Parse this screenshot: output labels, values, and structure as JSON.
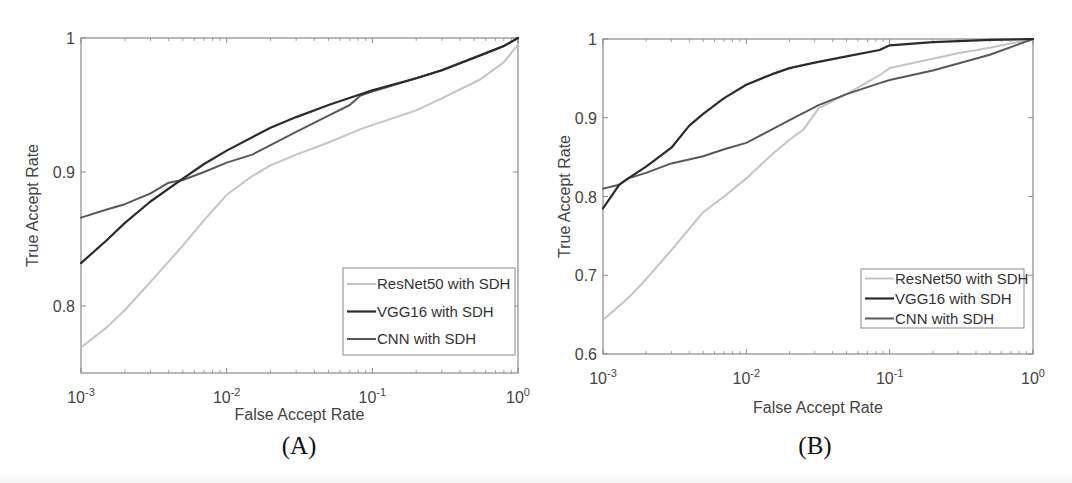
{
  "figure": {
    "panels": [
      {
        "id": "A",
        "caption": "(A)"
      },
      {
        "id": "B",
        "caption": "(B)"
      }
    ]
  },
  "colors": {
    "resnet50": "#c4c4c4",
    "vgg16": "#2b2b2b",
    "cnn": "#585858",
    "axis": "#8a8a8a",
    "text": "#444444"
  },
  "chart_data": [
    {
      "panel": "A",
      "type": "line",
      "title": "",
      "xlabel": "False Accept Rate",
      "ylabel": "True Accept Rate",
      "xscale": "log",
      "xlim": [
        0.001,
        1
      ],
      "ylim": [
        0.75,
        1
      ],
      "xticks": [
        0.001,
        0.01,
        0.1,
        1
      ],
      "xtick_labels": [
        [
          "10",
          "-3"
        ],
        [
          "10",
          "-2"
        ],
        [
          "10",
          "-1"
        ],
        [
          "10",
          "0"
        ]
      ],
      "yticks": [
        0.8,
        0.9,
        1
      ],
      "ytick_labels": [
        "0.8",
        "0.9",
        "1"
      ],
      "grid": false,
      "legend_position": "lower right",
      "legend": [
        "ResNet50 with SDH",
        "VGG16 with SDH",
        "CNN with SDH"
      ],
      "series": [
        {
          "name": "ResNet50 with SDH",
          "color_key": "resnet50",
          "width": 2,
          "x": [
            0.001,
            0.0015,
            0.002,
            0.003,
            0.005,
            0.007,
            0.01,
            0.015,
            0.02,
            0.03,
            0.05,
            0.083,
            0.1,
            0.2,
            0.3,
            0.55,
            0.8,
            1
          ],
          "y": [
            0.769,
            0.784,
            0.797,
            0.818,
            0.845,
            0.864,
            0.883,
            0.897,
            0.905,
            0.913,
            0.922,
            0.932,
            0.935,
            0.946,
            0.955,
            0.969,
            0.982,
            0.995
          ]
        },
        {
          "name": "VGG16 with SDH",
          "color_key": "vgg16",
          "width": 2.2,
          "x": [
            0.001,
            0.0015,
            0.002,
            0.003,
            0.005,
            0.007,
            0.01,
            0.015,
            0.02,
            0.03,
            0.05,
            0.083,
            0.1,
            0.2,
            0.3,
            0.55,
            0.8,
            1
          ],
          "y": [
            0.832,
            0.849,
            0.862,
            0.878,
            0.895,
            0.906,
            0.916,
            0.926,
            0.933,
            0.941,
            0.95,
            0.958,
            0.961,
            0.97,
            0.976,
            0.987,
            0.994,
            1.0
          ]
        },
        {
          "name": "CNN with SDH",
          "color_key": "cnn",
          "width": 2,
          "x": [
            0.001,
            0.0015,
            0.002,
            0.003,
            0.004,
            0.005,
            0.007,
            0.01,
            0.015,
            0.02,
            0.03,
            0.05,
            0.07,
            0.083,
            0.1,
            0.2,
            0.3,
            0.55,
            0.8,
            1
          ],
          "y": [
            0.866,
            0.872,
            0.876,
            0.884,
            0.892,
            0.894,
            0.9,
            0.907,
            0.913,
            0.92,
            0.93,
            0.942,
            0.95,
            0.957,
            0.96,
            0.97,
            0.976,
            0.987,
            0.994,
            1.0
          ]
        }
      ]
    },
    {
      "panel": "B",
      "type": "line",
      "title": "",
      "xlabel": "False Accept Rate",
      "ylabel": "True Accept Rate",
      "xscale": "log",
      "xlim": [
        0.001,
        1
      ],
      "ylim": [
        0.6,
        1
      ],
      "xticks": [
        0.001,
        0.01,
        0.1,
        1
      ],
      "xtick_labels": [
        [
          "10",
          "-3"
        ],
        [
          "10",
          "-2"
        ],
        [
          "10",
          "-1"
        ],
        [
          "10",
          "0"
        ]
      ],
      "yticks": [
        0.6,
        0.7,
        0.8,
        0.9,
        1
      ],
      "ytick_labels": [
        "0.6",
        "0.7",
        "0.8",
        "0.9",
        "1"
      ],
      "grid": false,
      "legend_position": "lower right",
      "legend": [
        "ResNet50 with SDH",
        "VGG16 with SDH",
        "CNN with SDH"
      ],
      "series": [
        {
          "name": "ResNet50 with SDH",
          "color_key": "resnet50",
          "width": 2,
          "x": [
            0.001,
            0.0015,
            0.002,
            0.003,
            0.005,
            0.007,
            0.01,
            0.015,
            0.02,
            0.025,
            0.032,
            0.05,
            0.085,
            0.1,
            0.2,
            0.3,
            0.5,
            1
          ],
          "y": [
            0.643,
            0.671,
            0.695,
            0.732,
            0.78,
            0.8,
            0.823,
            0.853,
            0.872,
            0.885,
            0.912,
            0.93,
            0.954,
            0.963,
            0.975,
            0.982,
            0.989,
            1.0
          ]
        },
        {
          "name": "VGG16 with SDH",
          "color_key": "vgg16",
          "width": 2.2,
          "x": [
            0.001,
            0.0013,
            0.0015,
            0.002,
            0.003,
            0.004,
            0.005,
            0.007,
            0.01,
            0.015,
            0.02,
            0.03,
            0.05,
            0.085,
            0.1,
            0.2,
            0.5,
            1
          ],
          "y": [
            0.785,
            0.815,
            0.823,
            0.838,
            0.862,
            0.89,
            0.905,
            0.925,
            0.942,
            0.955,
            0.963,
            0.97,
            0.978,
            0.986,
            0.992,
            0.996,
            0.999,
            1.0
          ]
        },
        {
          "name": "CNN with SDH",
          "color_key": "cnn",
          "width": 2,
          "x": [
            0.001,
            0.0013,
            0.0015,
            0.002,
            0.003,
            0.005,
            0.007,
            0.01,
            0.015,
            0.02,
            0.032,
            0.05,
            0.085,
            0.1,
            0.2,
            0.5,
            1
          ],
          "y": [
            0.81,
            0.815,
            0.823,
            0.83,
            0.842,
            0.851,
            0.86,
            0.868,
            0.885,
            0.897,
            0.916,
            0.93,
            0.944,
            0.948,
            0.96,
            0.98,
            1.0
          ]
        }
      ]
    }
  ],
  "layout": {
    "panels": [
      {
        "plot": {
          "left": 81,
          "top": 38,
          "right": 518,
          "bottom": 373
        },
        "ylabel_x": 38,
        "xlabel_y": 420,
        "xtick_y": 403,
        "legend": {
          "x": 343,
          "y": 268,
          "w": 172,
          "h": 87,
          "row_h": 27.5,
          "font": 15
        }
      },
      {
        "plot": {
          "left": 603,
          "top": 39,
          "right": 1033,
          "bottom": 354
        },
        "ylabel_x": 570,
        "xlabel_y": 413,
        "xtick_y": 384,
        "legend": {
          "x": 861,
          "y": 269,
          "w": 163,
          "h": 59,
          "row_h": 20,
          "font": 15
        }
      }
    ]
  }
}
